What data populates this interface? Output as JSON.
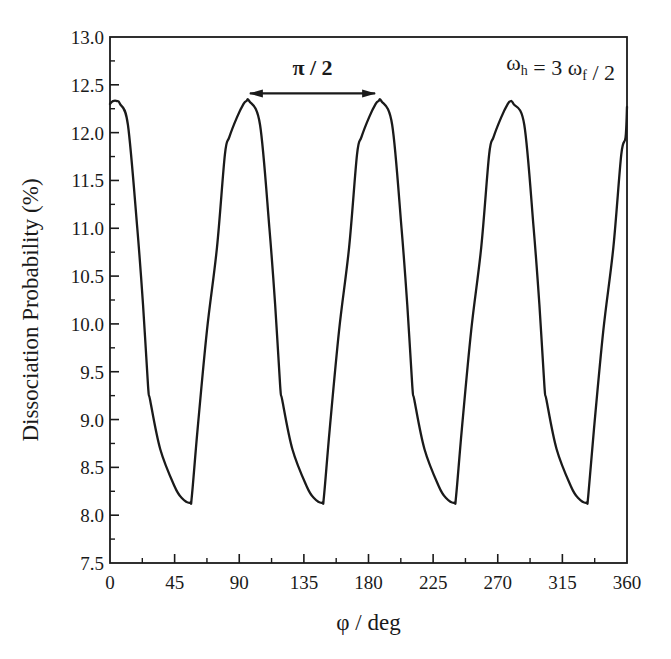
{
  "chart_data": {
    "type": "line",
    "title": "",
    "xlabel": "φ / deg",
    "ylabel": "Dissociation Probability (%)",
    "xlim": [
      0,
      360
    ],
    "ylim": [
      7.5,
      13.0
    ],
    "xticks": [
      0,
      45,
      90,
      135,
      180,
      225,
      270,
      315,
      360
    ],
    "xtick_labels": [
      "0",
      "45",
      "90",
      "135",
      "180",
      "225",
      "270",
      "315",
      "360"
    ],
    "yticks": [
      7.5,
      8.0,
      8.5,
      9.0,
      9.5,
      10.0,
      10.5,
      11.0,
      11.5,
      12.0,
      12.5,
      13.0
    ],
    "ytick_labels": [
      "7.5",
      "8.0",
      "8.5",
      "9.0",
      "9.5",
      "10.0",
      "10.5",
      "11.0",
      "11.5",
      "12.0",
      "12.5",
      "13.0"
    ],
    "grid": false,
    "legend": "none",
    "series": [
      {
        "name": "dissociation-probability",
        "x": [
          0,
          2,
          5,
          7,
          12.5,
          19,
          23,
          26.5,
          28,
          35,
          45,
          50,
          55.7,
          57,
          61,
          67.5,
          74.5,
          80,
          83,
          88.4,
          93,
          95,
          97,
          104.5,
          111,
          115,
          118.5,
          120,
          127,
          137,
          142,
          147.7,
          149,
          153,
          159.5,
          166.5,
          172,
          175,
          180.4,
          185,
          187,
          189,
          196.5,
          203,
          207,
          210.5,
          212,
          219,
          229,
          234,
          239.7,
          241,
          245,
          251.5,
          258.5,
          264,
          267,
          272.4,
          277,
          279,
          281,
          288.5,
          295,
          299,
          302.5,
          304,
          311,
          321,
          326,
          331.7,
          333,
          337,
          343.5,
          350.5,
          356,
          359,
          360
        ],
        "values": [
          12.3,
          12.33,
          12.33,
          12.3,
          12.08,
          11.0,
          10.2,
          9.35,
          9.2,
          8.69,
          8.3,
          8.18,
          8.13,
          8.2,
          8.9,
          9.93,
          10.8,
          11.77,
          11.95,
          12.16,
          12.3,
          12.33,
          12.33,
          12.08,
          11.0,
          10.2,
          9.35,
          9.2,
          8.69,
          8.3,
          8.18,
          8.13,
          8.2,
          8.9,
          9.93,
          10.8,
          11.77,
          11.95,
          12.16,
          12.3,
          12.33,
          12.33,
          12.08,
          11.0,
          10.2,
          9.35,
          9.2,
          8.69,
          8.3,
          8.18,
          8.13,
          8.2,
          8.9,
          9.93,
          10.8,
          11.77,
          11.95,
          12.16,
          12.3,
          12.33,
          12.3,
          12.08,
          11.0,
          10.2,
          9.35,
          9.2,
          8.69,
          8.3,
          8.18,
          8.13,
          8.2,
          8.9,
          9.93,
          10.8,
          11.77,
          11.95,
          12.27
        ]
      }
    ],
    "annotations": [
      {
        "type": "double-arrow",
        "label": "π / 2",
        "x_start": 96,
        "x_end": 186,
        "y": 12.42
      },
      {
        "type": "text",
        "label_parts": [
          {
            "text": "ω",
            "sub": "h"
          },
          {
            "text": " = 3 "
          },
          {
            "text": "ω",
            "sub": "f"
          },
          {
            "text": " / 2"
          }
        ],
        "position": "top-right"
      }
    ]
  }
}
